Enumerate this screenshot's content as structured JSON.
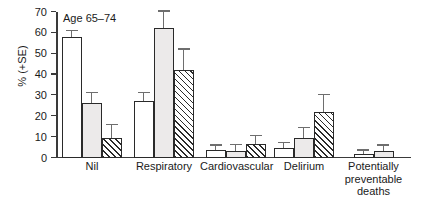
{
  "chart_data": {
    "type": "bar",
    "title": "Age 65–74",
    "xlabel": "",
    "ylabel": "% (+SE)",
    "ylim": [
      0,
      70
    ],
    "yticks": [
      0,
      10,
      20,
      30,
      40,
      50,
      60,
      70
    ],
    "ytick_labels": [
      "0",
      "10",
      "20",
      "30",
      "40",
      "50",
      "60",
      "70"
    ],
    "grid": false,
    "legend": "none",
    "error_bars": "+SE (upper only)",
    "categories": [
      "Nil",
      "Respiratory",
      "Cardiovascular",
      "Delirium",
      "Potentially preventable deaths"
    ],
    "category_label_lines": [
      [
        "Nil"
      ],
      [
        "Respiratory"
      ],
      [
        "Cardiovascular"
      ],
      [
        "Delirium"
      ],
      [
        "Potentially",
        "preventable",
        "deaths"
      ]
    ],
    "series": [
      {
        "name": "series-1",
        "style": "open-white",
        "values": [
          58.0,
          27.3,
          4.0,
          5.0,
          2.0
        ],
        "errors": [
          3.0,
          4.0,
          2.0,
          2.0,
          1.6
        ]
      },
      {
        "name": "series-2",
        "style": "light-gray",
        "values": [
          26.3,
          62.2,
          3.3,
          9.5,
          3.5
        ],
        "errors": [
          5.0,
          8.0,
          3.0,
          5.0,
          2.5
        ]
      },
      {
        "name": "series-3",
        "style": "hatched",
        "values": [
          9.8,
          42.0,
          6.5,
          22.0,
          null
        ],
        "errors": [
          6.0,
          10.0,
          4.0,
          8.0,
          null
        ]
      }
    ],
    "colors": {
      "series_1_fill": "#ffffff",
      "series_2_fill": "#eceaea",
      "series_3_fill": "#ffffff",
      "bar_outline": "#2a2a2a",
      "error_bar": "#6e6e6e",
      "axis": "#3a3a3a",
      "text": "#1a1a1a",
      "background": "#ffffff"
    }
  }
}
